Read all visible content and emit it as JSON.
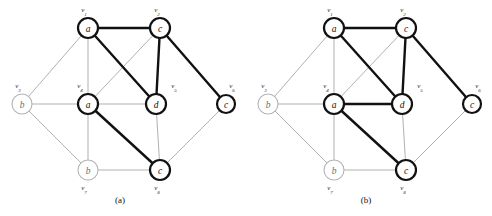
{
  "figure": {
    "width": 492,
    "height": 216,
    "background": "#ffffff",
    "colors": {
      "bold_edge": "#111111",
      "thin_edge": "#a8a8a8",
      "dark_node_stroke": "#111111",
      "light_node_stroke": "#b4b4b4",
      "node_fill": "#ffffff",
      "label_text": "#111111",
      "light_label_text": "#6e6e6e"
    }
  },
  "panels": [
    {
      "id": "panel-a",
      "caption": "(a)",
      "caption_x": 120,
      "caption_y": 203,
      "nodes": [
        {
          "id": "v1",
          "tag_v": "v",
          "tag_sub": "1",
          "label": "a",
          "x": 88,
          "y": 28,
          "r": 10,
          "emphasis": "dark",
          "tag_x": 84,
          "tag_y": 12
        },
        {
          "id": "v2",
          "tag_v": "v",
          "tag_sub": "2",
          "label": "c",
          "x": 160,
          "y": 28,
          "r": 10,
          "emphasis": "dark",
          "tag_x": 157,
          "tag_y": 12
        },
        {
          "id": "v3",
          "tag_v": "v",
          "tag_sub": "3",
          "label": "b",
          "x": 22,
          "y": 104,
          "r": 10,
          "emphasis": "light",
          "tag_x": 18,
          "tag_y": 88
        },
        {
          "id": "v4",
          "tag_v": "v",
          "tag_sub": "4",
          "label": "a",
          "x": 88,
          "y": 104,
          "r": 10,
          "emphasis": "dark",
          "tag_x": 80,
          "tag_y": 88
        },
        {
          "id": "v5",
          "tag_v": "v",
          "tag_sub": "5",
          "label": "d",
          "x": 156,
          "y": 104,
          "r": 10,
          "emphasis": "dark",
          "tag_x": 174,
          "tag_y": 88
        },
        {
          "id": "v6",
          "tag_v": "v",
          "tag_sub": "6",
          "label": "c",
          "x": 226,
          "y": 104,
          "r": 9,
          "emphasis": "dark",
          "tag_x": 232,
          "tag_y": 88
        },
        {
          "id": "v7",
          "tag_v": "v",
          "tag_sub": "7",
          "label": "b",
          "x": 88,
          "y": 170,
          "r": 10,
          "emphasis": "light",
          "tag_x": 84,
          "tag_y": 190
        },
        {
          "id": "v8",
          "tag_v": "v",
          "tag_sub": "8",
          "label": "c",
          "x": 160,
          "y": 170,
          "r": 10,
          "emphasis": "dark",
          "tag_x": 157,
          "tag_y": 190
        }
      ],
      "edges": [
        {
          "from": "v1",
          "to": "v2",
          "weight": "bold"
        },
        {
          "from": "v1",
          "to": "v5",
          "weight": "bold"
        },
        {
          "from": "v2",
          "to": "v5",
          "weight": "bold"
        },
        {
          "from": "v2",
          "to": "v6",
          "weight": "bold"
        },
        {
          "from": "v4",
          "to": "v8",
          "weight": "bold"
        },
        {
          "from": "v1",
          "to": "v3",
          "weight": "thin"
        },
        {
          "from": "v1",
          "to": "v4",
          "weight": "thin"
        },
        {
          "from": "v2",
          "to": "v4",
          "weight": "thin"
        },
        {
          "from": "v3",
          "to": "v4",
          "weight": "thin"
        },
        {
          "from": "v3",
          "to": "v7",
          "weight": "thin"
        },
        {
          "from": "v4",
          "to": "v5",
          "weight": "thin"
        },
        {
          "from": "v4",
          "to": "v7",
          "weight": "thin"
        },
        {
          "from": "v5",
          "to": "v8",
          "weight": "thin"
        },
        {
          "from": "v6",
          "to": "v8",
          "weight": "thin"
        },
        {
          "from": "v7",
          "to": "v8",
          "weight": "thin"
        }
      ]
    },
    {
      "id": "panel-b",
      "caption": "(b)",
      "caption_x": 120,
      "caption_y": 203,
      "nodes": [
        {
          "id": "v1",
          "tag_v": "v",
          "tag_sub": "1",
          "label": "a",
          "x": 88,
          "y": 28,
          "r": 10,
          "emphasis": "dark",
          "tag_x": 84,
          "tag_y": 12
        },
        {
          "id": "v2",
          "tag_v": "v",
          "tag_sub": "2",
          "label": "c",
          "x": 160,
          "y": 28,
          "r": 10,
          "emphasis": "dark",
          "tag_x": 157,
          "tag_y": 12
        },
        {
          "id": "v3",
          "tag_v": "v",
          "tag_sub": "3",
          "label": "b",
          "x": 22,
          "y": 104,
          "r": 10,
          "emphasis": "light",
          "tag_x": 18,
          "tag_y": 88
        },
        {
          "id": "v4",
          "tag_v": "v",
          "tag_sub": "4",
          "label": "a",
          "x": 88,
          "y": 104,
          "r": 10,
          "emphasis": "dark",
          "tag_x": 80,
          "tag_y": 88
        },
        {
          "id": "v5",
          "tag_v": "v",
          "tag_sub": "5",
          "label": "d",
          "x": 156,
          "y": 104,
          "r": 10,
          "emphasis": "dark",
          "tag_x": 174,
          "tag_y": 88
        },
        {
          "id": "v6",
          "tag_v": "v",
          "tag_sub": "6",
          "label": "c",
          "x": 226,
          "y": 104,
          "r": 9,
          "emphasis": "dark",
          "tag_x": 232,
          "tag_y": 88
        },
        {
          "id": "v7",
          "tag_v": "v",
          "tag_sub": "7",
          "label": "b",
          "x": 88,
          "y": 170,
          "r": 10,
          "emphasis": "light",
          "tag_x": 84,
          "tag_y": 190
        },
        {
          "id": "v8",
          "tag_v": "v",
          "tag_sub": "8",
          "label": "c",
          "x": 160,
          "y": 170,
          "r": 10,
          "emphasis": "dark",
          "tag_x": 157,
          "tag_y": 190
        }
      ],
      "edges": [
        {
          "from": "v1",
          "to": "v2",
          "weight": "bold"
        },
        {
          "from": "v1",
          "to": "v5",
          "weight": "bold"
        },
        {
          "from": "v2",
          "to": "v5",
          "weight": "bold"
        },
        {
          "from": "v2",
          "to": "v6",
          "weight": "bold"
        },
        {
          "from": "v4",
          "to": "v5",
          "weight": "bold"
        },
        {
          "from": "v4",
          "to": "v8",
          "weight": "bold"
        },
        {
          "from": "v1",
          "to": "v3",
          "weight": "thin"
        },
        {
          "from": "v1",
          "to": "v4",
          "weight": "thin"
        },
        {
          "from": "v2",
          "to": "v4",
          "weight": "thin"
        },
        {
          "from": "v3",
          "to": "v4",
          "weight": "thin"
        },
        {
          "from": "v3",
          "to": "v7",
          "weight": "thin"
        },
        {
          "from": "v4",
          "to": "v7",
          "weight": "thin"
        },
        {
          "from": "v5",
          "to": "v8",
          "weight": "thin"
        },
        {
          "from": "v6",
          "to": "v8",
          "weight": "thin"
        },
        {
          "from": "v7",
          "to": "v8",
          "weight": "thin"
        }
      ]
    }
  ]
}
